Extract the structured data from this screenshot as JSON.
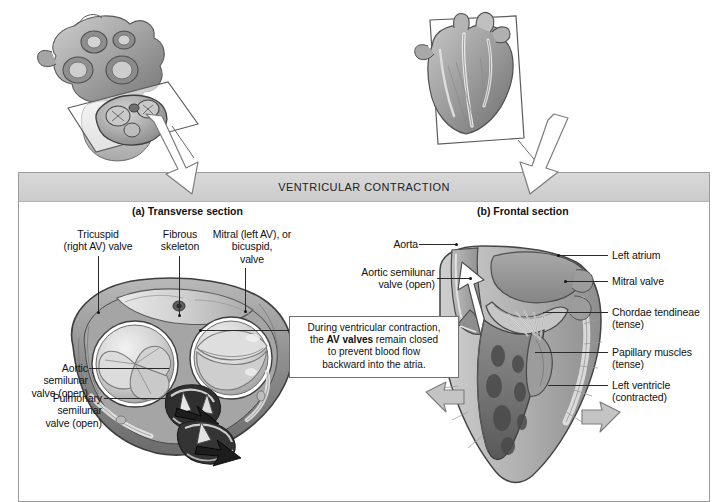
{
  "figure": {
    "banner_title": "VENTRICULAR CONTRACTION",
    "panels": [
      {
        "id": "a",
        "caption": "(a) Transverse section"
      },
      {
        "id": "b",
        "caption": "(b) Frontal section"
      }
    ]
  },
  "callout": {
    "line1": "During ventricular contraction,",
    "line2_pre": "the ",
    "line2_bold": "AV valves",
    "line2_post": " remain closed",
    "line3": "to prevent blood flow",
    "line4": "backward into the atria."
  },
  "transverse_labels": {
    "tricuspid": "Tricuspid\n(right AV) valve",
    "fibrous_skeleton": "Fibrous\nskeleton",
    "mitral": "Mitral (left AV), or\nbicuspid,\nvalve",
    "aortic_semilunar": "Aortic\nsemilunar\nvalve (open)",
    "pulmonary_semilunar": "Pulmonary\nsemilunar\nvalve (open)"
  },
  "frontal_labels": {
    "aorta": "Aorta",
    "aortic_semilunar": "Aortic semilunar\nvalve (open)",
    "left_atrium": "Left atrium",
    "mitral_valve": "Mitral valve",
    "chordae_tendineae": "Chordae tendineae\n(tense)",
    "papillary_muscles": "Papillary muscles\n(tense)",
    "left_ventricle": "Left ventricle\n(contracted)"
  },
  "icons": {
    "pointer_arrow_left": "down-right-arrow-icon",
    "pointer_arrow_right": "down-left-arrow-icon",
    "blood_flow_arrow": "blood-flow-arrow-icon",
    "contraction_arrow": "contraction-arrow-icon",
    "section_plane": "cutting-plane-icon"
  },
  "colors": {
    "banner_bg": "#d2d2d2",
    "panel_border": "#9a9a9a",
    "leader_line": "#2a2a2a",
    "tissue_mid": "#9a9a9a",
    "tissue_light": "#d9d9d9",
    "tissue_dark": "#5e5e5e",
    "chamber_dark": "#3a3a3a"
  }
}
